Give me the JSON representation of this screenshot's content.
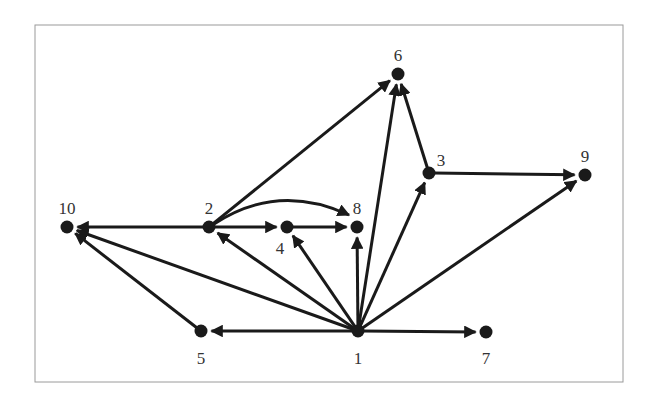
{
  "diagram": {
    "type": "directed-graph",
    "frame": {
      "x": 35,
      "y": 25,
      "width": 588,
      "height": 357
    },
    "colors": {
      "edge": "#1a1a1a",
      "node": "#1a1a1a",
      "label": "#333333",
      "frame": "#9a9a9a"
    },
    "nodes": [
      {
        "id": "1",
        "label": "1",
        "x": 358,
        "y": 331,
        "lx": 358,
        "ly": 360
      },
      {
        "id": "2",
        "label": "2",
        "x": 209,
        "y": 227,
        "lx": 209,
        "ly": 210
      },
      {
        "id": "3",
        "label": "3",
        "x": 429,
        "y": 173,
        "lx": 441,
        "ly": 162
      },
      {
        "id": "4",
        "label": "4",
        "x": 287,
        "y": 227,
        "lx": 280,
        "ly": 250
      },
      {
        "id": "5",
        "label": "5",
        "x": 201,
        "y": 331,
        "lx": 201,
        "ly": 360
      },
      {
        "id": "6",
        "label": "6",
        "x": 398,
        "y": 74,
        "lx": 398,
        "ly": 57
      },
      {
        "id": "7",
        "label": "7",
        "x": 486,
        "y": 332,
        "lx": 486,
        "ly": 360
      },
      {
        "id": "8",
        "label": "8",
        "x": 357,
        "y": 227,
        "lx": 357,
        "ly": 210
      },
      {
        "id": "9",
        "label": "9",
        "x": 585,
        "y": 175,
        "lx": 585,
        "ly": 158
      },
      {
        "id": "10",
        "label": "10",
        "x": 67,
        "y": 227,
        "lx": 67,
        "ly": 210
      }
    ],
    "edges": [
      {
        "from": "1",
        "to": "5"
      },
      {
        "from": "1",
        "to": "7"
      },
      {
        "from": "1",
        "to": "10"
      },
      {
        "from": "1",
        "to": "2"
      },
      {
        "from": "1",
        "to": "4"
      },
      {
        "from": "1",
        "to": "8"
      },
      {
        "from": "1",
        "to": "6"
      },
      {
        "from": "1",
        "to": "3"
      },
      {
        "from": "1",
        "to": "9"
      },
      {
        "from": "2",
        "to": "10"
      },
      {
        "from": "2",
        "to": "4"
      },
      {
        "from": "2",
        "to": "8",
        "curved": true
      },
      {
        "from": "2",
        "to": "6"
      },
      {
        "from": "4",
        "to": "8"
      },
      {
        "from": "3",
        "to": "6"
      },
      {
        "from": "3",
        "to": "9"
      },
      {
        "from": "5",
        "to": "10"
      }
    ]
  }
}
